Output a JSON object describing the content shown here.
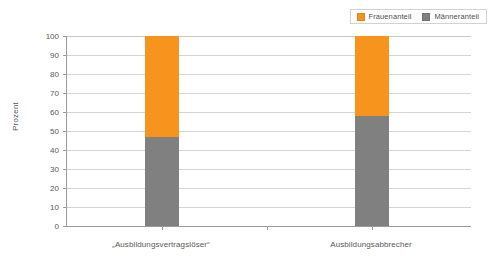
{
  "chart_data": {
    "type": "bar",
    "title": "",
    "subtitle": "",
    "xlabel": "",
    "ylabel": "Prozent",
    "ylim": [
      0,
      100
    ],
    "ytick_step": 10,
    "yticks": [
      "100",
      "90",
      "80",
      "70",
      "60",
      "50",
      "40",
      "30",
      "20",
      "10",
      "0"
    ],
    "grid": true,
    "stacked": true,
    "legend_position": "top-right",
    "categories": [
      "„Ausbildungsvertragslöser“",
      "Ausbildungsabbrecher"
    ],
    "series": [
      {
        "name": "Männeranteil",
        "color": "#808080",
        "values": [
          47,
          58
        ]
      },
      {
        "name": "Frauenanteil",
        "color": "#F7941D",
        "values": [
          53,
          42
        ]
      }
    ]
  },
  "legend": {
    "items": [
      {
        "label": "Frauenanteil",
        "color": "#F7941D",
        "icon": "orange-square-swatch"
      },
      {
        "label": "Männeranteil",
        "color": "#808080",
        "icon": "gray-square-swatch"
      }
    ]
  },
  "axes": {
    "y": {
      "title": "Prozent",
      "ticks": [
        "100",
        "90",
        "80",
        "70",
        "60",
        "50",
        "40",
        "30",
        "20",
        "10",
        "0"
      ]
    },
    "x": {
      "ticks": [
        "„Ausbildungsvertragslöser“",
        "Ausbildungsabbrecher"
      ]
    }
  },
  "colors": {
    "frauenanteil": "#F7941D",
    "maenneranteil": "#808080",
    "axis": "#9A9A9A",
    "grid": "#D4D4D6",
    "text": "#58585A",
    "legend_border": "#D2D2D2",
    "background": "#FFFFFF"
  }
}
